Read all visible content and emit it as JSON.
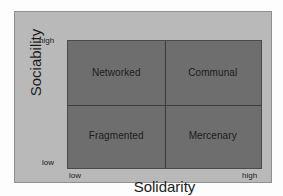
{
  "chart_data": {
    "type": "table",
    "title": "",
    "xlabel": "Solidarity",
    "ylabel": "Sociability",
    "x_ticks": [
      "low",
      "high"
    ],
    "y_ticks": [
      "low",
      "high"
    ],
    "grid": true,
    "legend": "none",
    "quadrants": [
      {
        "id": "top-left",
        "label": "Networked",
        "x": "low",
        "y": "high"
      },
      {
        "id": "top-right",
        "label": "Communal",
        "x": "high",
        "y": "high"
      },
      {
        "id": "bottom-left",
        "label": "Fragmented",
        "x": "low",
        "y": "low"
      },
      {
        "id": "bottom-right",
        "label": "Mercenary",
        "x": "high",
        "y": "low"
      }
    ]
  },
  "colors": {
    "page_background": "#fdfdfd",
    "frame_background": "#b9b9b9",
    "plot_fill": "#6e6e6e",
    "plot_border": "#4a4a4a",
    "divider": "#3c3c3c",
    "text": "#1c1c1c"
  }
}
